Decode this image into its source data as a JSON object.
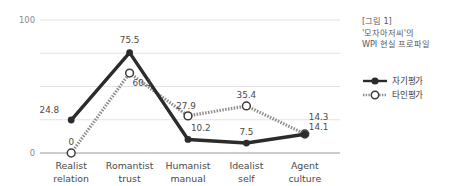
{
  "chart_data": {
    "type": "line",
    "title": "",
    "xlabel": "",
    "ylabel": "",
    "ylim": [
      0,
      100
    ],
    "grid": true,
    "gridlines": [
      0,
      25,
      50,
      75,
      100
    ],
    "axis_tick_labels": [
      "100",
      "0"
    ],
    "y_top_label": "100",
    "y_bottom_label": "0",
    "categories": [
      "Realist relation",
      "Romantist trust",
      "Humanist manual",
      "Idealist self",
      "Agent culture"
    ],
    "category_lines": [
      [
        "Realist",
        "relation"
      ],
      [
        "Romantist",
        "trust"
      ],
      [
        "Humanist",
        "manual"
      ],
      [
        "Idealist",
        "self"
      ],
      [
        "Agent",
        "culture"
      ]
    ],
    "legend_position": "right",
    "series": [
      {
        "name": "자기평가",
        "style": "solid",
        "color": "#2b2b2b",
        "marker": "filled-circle",
        "values": [
          24.8,
          75.5,
          10.2,
          7.5,
          14.1
        ],
        "labels": [
          "24.8",
          "75.5",
          "10.2",
          "7.5",
          "14.1"
        ]
      },
      {
        "name": "타인평가",
        "style": "dotted",
        "color": "#8c8c8c",
        "marker": "hollow-circle",
        "values": [
          0,
          60.1,
          27.9,
          35.4,
          14.3
        ],
        "labels": [
          "0",
          "60.1",
          "27.9",
          "35.4",
          "14.3"
        ]
      }
    ]
  },
  "caption": {
    "line1": "[그림 1]",
    "line2": "'모자아저씨'의",
    "line3": "WPI 현실 프로파일"
  },
  "legend": {
    "items": [
      {
        "label": "자기평가"
      },
      {
        "label": "타인평가"
      }
    ]
  },
  "colors": {
    "series_self": "#2b2b2b",
    "series_other": "#8c8c8c",
    "grid": "#e2e2e2",
    "axis_text": "#8a8a8a",
    "label_text": "#4a4a4a",
    "caption_text": "#58585a"
  }
}
